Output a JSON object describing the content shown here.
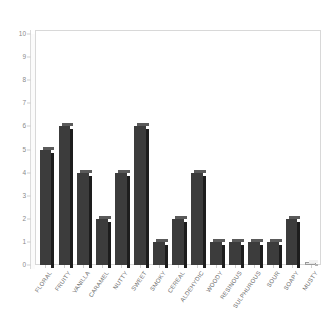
{
  "chart_data": {
    "type": "bar",
    "title": "",
    "subtitle": "",
    "xlabel": "",
    "ylabel": "",
    "ylim": [
      0,
      10
    ],
    "yticks": [
      0,
      1,
      2,
      3,
      4,
      5,
      6,
      7,
      8,
      9,
      10
    ],
    "grid": false,
    "legend": false,
    "legend_position": "none",
    "categories": [
      "FLORAL",
      "FRUITY",
      "VANILLA",
      "CARAMEL",
      "NUTTY",
      "SWEET",
      "SMOKY",
      "CEREAL",
      "ALDEHYDIC",
      "WOODY",
      "RESINOUS",
      "SULPHUROUS",
      "SOUR",
      "SOAPY",
      "MUSTY"
    ],
    "values": [
      5,
      6,
      4,
      2,
      4,
      6,
      1,
      2,
      4,
      1,
      1,
      1,
      1,
      2,
      0
    ],
    "series": [
      {
        "name": "Count",
        "values": [
          5,
          6,
          4,
          2,
          4,
          6,
          1,
          2,
          4,
          1,
          1,
          1,
          1,
          2,
          0
        ]
      }
    ],
    "colors": {
      "bar_face": "#3c3c3c",
      "bar_side": "#1d1d1d",
      "bar_top": "#5a5a5a",
      "plot_background": "#ffffff",
      "frame": "#d8d8d8",
      "tick_text": "#8a8a8a",
      "label_text": "#6e6e6e"
    }
  }
}
